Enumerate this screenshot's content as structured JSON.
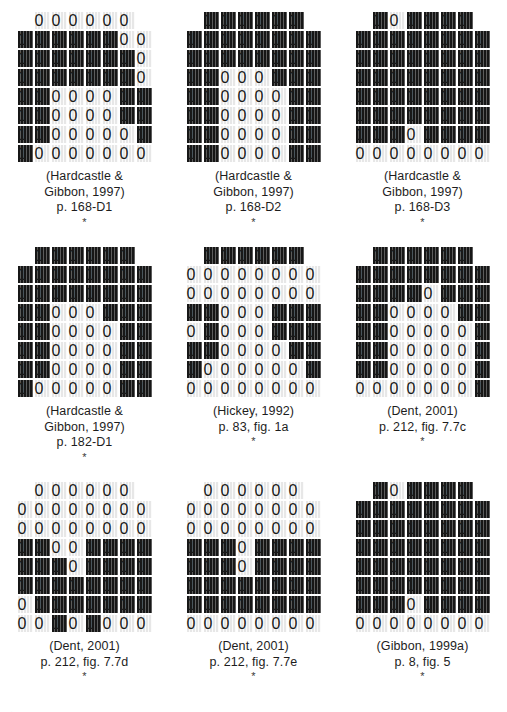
{
  "figure": {
    "type": "electropalatography-palatogram-array",
    "rows": 3,
    "columns": 3,
    "grid_spec": {
      "total_rows": 8,
      "row_widths": [
        6,
        8,
        8,
        8,
        8,
        8,
        8,
        8
      ],
      "on_label": "contact",
      "off_label": "no-contact"
    },
    "colors": {
      "contact": "#161616",
      "no_contact": "#e7e7e7",
      "background": "#ffffff",
      "text": "#1d1d1d"
    },
    "panels": [
      {
        "id": "panel-1",
        "caption_lines": [
          "(Hardcastle &",
          "Gibbon, 1997)",
          "p. 168-D1"
        ],
        "asterisk": "*",
        "pattern": [
          [
            0,
            0,
            0,
            0,
            0,
            0
          ],
          [
            1,
            1,
            1,
            1,
            1,
            1,
            0,
            0
          ],
          [
            1,
            1,
            1,
            1,
            1,
            1,
            1,
            0
          ],
          [
            1,
            1,
            1,
            1,
            1,
            1,
            1,
            0
          ],
          [
            1,
            1,
            0,
            0,
            0,
            0,
            1,
            1
          ],
          [
            1,
            1,
            0,
            0,
            0,
            0,
            1,
            1
          ],
          [
            1,
            1,
            0,
            0,
            0,
            0,
            0,
            1
          ],
          [
            1,
            0,
            0,
            0,
            0,
            0,
            0,
            0
          ]
        ]
      },
      {
        "id": "panel-2",
        "caption_lines": [
          "(Hardcastle &",
          "Gibbon, 1997)",
          "p. 168-D2"
        ],
        "asterisk": "*",
        "pattern": [
          [
            1,
            1,
            1,
            1,
            1,
            1
          ],
          [
            1,
            1,
            1,
            1,
            1,
            1,
            1,
            1
          ],
          [
            1,
            1,
            1,
            1,
            1,
            1,
            1,
            1
          ],
          [
            1,
            1,
            0,
            0,
            0,
            1,
            1,
            1
          ],
          [
            1,
            1,
            0,
            0,
            0,
            0,
            1,
            1
          ],
          [
            1,
            1,
            0,
            0,
            0,
            0,
            1,
            1
          ],
          [
            1,
            1,
            0,
            0,
            0,
            0,
            1,
            1
          ],
          [
            1,
            1,
            0,
            0,
            0,
            0,
            1,
            1
          ]
        ]
      },
      {
        "id": "panel-3",
        "caption_lines": [
          "(Hardcastle &",
          "Gibbon, 1997)",
          "p. 168-D3"
        ],
        "asterisk": "*",
        "pattern": [
          [
            1,
            0,
            1,
            1,
            1,
            1
          ],
          [
            1,
            1,
            1,
            1,
            1,
            1,
            1,
            1
          ],
          [
            1,
            1,
            1,
            1,
            1,
            1,
            1,
            1
          ],
          [
            1,
            1,
            1,
            1,
            1,
            1,
            1,
            1
          ],
          [
            1,
            1,
            1,
            1,
            1,
            1,
            1,
            1
          ],
          [
            1,
            1,
            1,
            1,
            1,
            1,
            1,
            1
          ],
          [
            1,
            1,
            1,
            0,
            1,
            1,
            1,
            1
          ],
          [
            0,
            0,
            0,
            0,
            0,
            0,
            0,
            0
          ]
        ]
      },
      {
        "id": "panel-4",
        "caption_lines": [
          "(Hardcastle &",
          "Gibbon, 1997)",
          "p. 182-D1"
        ],
        "asterisk": "*",
        "pattern": [
          [
            1,
            1,
            1,
            1,
            1,
            1
          ],
          [
            1,
            1,
            1,
            1,
            1,
            1,
            1,
            1
          ],
          [
            1,
            1,
            1,
            1,
            1,
            1,
            1,
            1
          ],
          [
            1,
            1,
            0,
            0,
            0,
            1,
            1,
            1
          ],
          [
            1,
            1,
            0,
            0,
            0,
            0,
            1,
            1
          ],
          [
            1,
            1,
            0,
            0,
            0,
            0,
            1,
            1
          ],
          [
            1,
            1,
            0,
            0,
            0,
            0,
            1,
            1
          ],
          [
            1,
            0,
            0,
            0,
            0,
            0,
            1,
            1
          ]
        ]
      },
      {
        "id": "panel-5",
        "caption_lines": [
          "(Hickey, 1992)",
          "p. 83, fig. 1a"
        ],
        "asterisk": "*",
        "pattern": [
          [
            1,
            1,
            1,
            1,
            1,
            1
          ],
          [
            0,
            0,
            0,
            0,
            0,
            0,
            0,
            0
          ],
          [
            0,
            0,
            0,
            0,
            0,
            0,
            0,
            0
          ],
          [
            1,
            1,
            0,
            0,
            0,
            1,
            1,
            1
          ],
          [
            0,
            1,
            0,
            0,
            0,
            1,
            1,
            1
          ],
          [
            1,
            1,
            0,
            0,
            0,
            0,
            1,
            1
          ],
          [
            1,
            0,
            0,
            0,
            0,
            0,
            0,
            1
          ],
          [
            0,
            0,
            0,
            0,
            0,
            0,
            0,
            0
          ]
        ]
      },
      {
        "id": "panel-6",
        "caption_lines": [
          "(Dent, 2001)",
          "p. 212, fig. 7.7c"
        ],
        "asterisk": "*",
        "pattern": [
          [
            1,
            1,
            1,
            1,
            1,
            1
          ],
          [
            1,
            1,
            1,
            1,
            1,
            1,
            1,
            1
          ],
          [
            1,
            1,
            1,
            1,
            0,
            1,
            1,
            1
          ],
          [
            1,
            1,
            0,
            0,
            0,
            0,
            1,
            1
          ],
          [
            1,
            1,
            0,
            0,
            0,
            0,
            0,
            1
          ],
          [
            1,
            1,
            0,
            0,
            0,
            0,
            0,
            1
          ],
          [
            1,
            1,
            0,
            0,
            0,
            0,
            0,
            1
          ],
          [
            0,
            0,
            0,
            0,
            0,
            0,
            0,
            1
          ]
        ]
      },
      {
        "id": "panel-7",
        "caption_lines": [
          "(Dent, 2001)",
          "p. 212, fig. 7.7d"
        ],
        "asterisk": "*",
        "pattern": [
          [
            0,
            0,
            0,
            0,
            0,
            0
          ],
          [
            0,
            0,
            0,
            0,
            0,
            0,
            0,
            0
          ],
          [
            0,
            0,
            0,
            0,
            0,
            0,
            0,
            0
          ],
          [
            1,
            1,
            0,
            0,
            1,
            1,
            1,
            1
          ],
          [
            1,
            1,
            1,
            0,
            1,
            1,
            1,
            1
          ],
          [
            1,
            1,
            1,
            1,
            1,
            1,
            1,
            1
          ],
          [
            0,
            1,
            1,
            1,
            1,
            1,
            1,
            1
          ],
          [
            0,
            0,
            1,
            0,
            1,
            0,
            0,
            0
          ]
        ]
      },
      {
        "id": "panel-8",
        "caption_lines": [
          "(Dent, 2001)",
          "p. 212, fig. 7.7e"
        ],
        "asterisk": "*",
        "pattern": [
          [
            0,
            0,
            0,
            0,
            0,
            0
          ],
          [
            0,
            0,
            0,
            0,
            0,
            0,
            0,
            0
          ],
          [
            0,
            0,
            0,
            0,
            0,
            0,
            0,
            0
          ],
          [
            1,
            1,
            1,
            0,
            1,
            1,
            1,
            1
          ],
          [
            1,
            1,
            1,
            0,
            1,
            1,
            1,
            1
          ],
          [
            1,
            1,
            1,
            1,
            1,
            1,
            1,
            1
          ],
          [
            1,
            1,
            1,
            1,
            1,
            1,
            1,
            1
          ],
          [
            0,
            0,
            0,
            0,
            0,
            0,
            0,
            0
          ]
        ]
      },
      {
        "id": "panel-9",
        "caption_lines": [
          "(Gibbon, 1999a)",
          "p. 8, fig. 5"
        ],
        "asterisk": "*",
        "pattern": [
          [
            1,
            0,
            1,
            1,
            1,
            1
          ],
          [
            1,
            1,
            1,
            1,
            1,
            1,
            1,
            1
          ],
          [
            1,
            1,
            1,
            1,
            1,
            1,
            1,
            1
          ],
          [
            1,
            1,
            1,
            1,
            1,
            1,
            1,
            1
          ],
          [
            1,
            1,
            1,
            1,
            1,
            1,
            1,
            1
          ],
          [
            1,
            1,
            1,
            1,
            1,
            1,
            1,
            1
          ],
          [
            1,
            1,
            1,
            0,
            1,
            1,
            1,
            1
          ],
          [
            0,
            0,
            0,
            0,
            0,
            0,
            0,
            0
          ]
        ]
      }
    ]
  },
  "clipped_footer": {
    "text": "."
  }
}
